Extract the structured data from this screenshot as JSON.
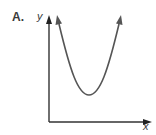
{
  "choice_label": "A.",
  "axes": {
    "x_label": "x",
    "y_label": "y"
  },
  "curve": {
    "type": "parabola",
    "opens": "up",
    "color": "#555555"
  },
  "colors": {
    "axis": "#333333",
    "text": "#3a3a3a"
  }
}
